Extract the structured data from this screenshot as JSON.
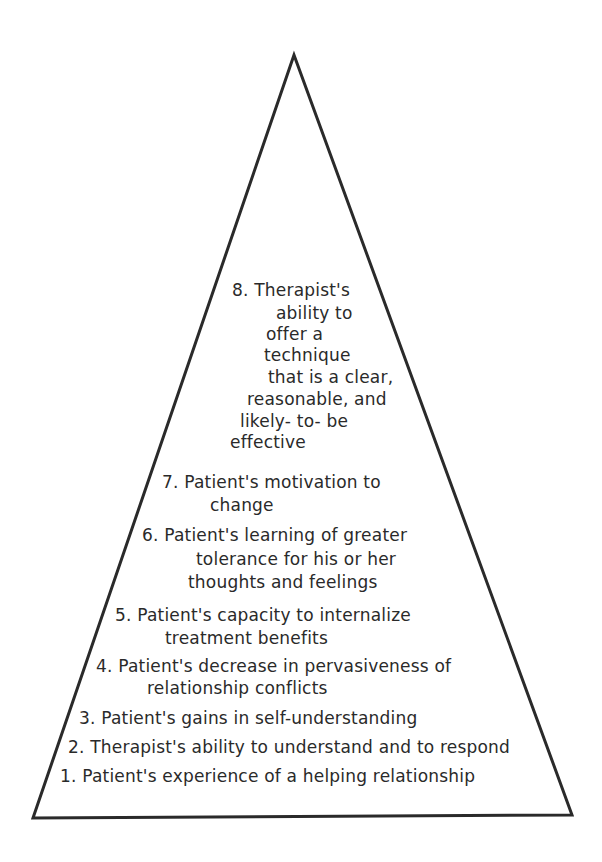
{
  "diagram": {
    "type": "pyramid",
    "shape": {
      "apex": [
        294,
        55
      ],
      "bottom_left": [
        33,
        818
      ],
      "bottom_right": [
        572,
        815
      ],
      "stroke_color": "#2a2a2a",
      "stroke_width": 3
    },
    "levels": [
      {
        "number": 8,
        "lines": [
          {
            "text": "8.  Therapist's",
            "x": 232,
            "y": 280
          },
          {
            "text": "ability  to",
            "x": 276,
            "y": 303
          },
          {
            "text": "offer  a",
            "x": 266,
            "y": 324
          },
          {
            "text": "technique",
            "x": 264,
            "y": 345
          },
          {
            "text": "that is a clear,",
            "x": 268,
            "y": 367
          },
          {
            "text": "reasonable, and",
            "x": 247,
            "y": 389
          },
          {
            "text": "likely- to- be",
            "x": 240,
            "y": 411
          },
          {
            "text": "effective",
            "x": 230,
            "y": 432
          }
        ]
      },
      {
        "number": 7,
        "lines": [
          {
            "text": "7.  Patient's motivation to",
            "x": 162,
            "y": 472
          },
          {
            "text": "change",
            "x": 210,
            "y": 495
          }
        ]
      },
      {
        "number": 6,
        "lines": [
          {
            "text": "6.  Patient's learning of greater",
            "x": 142,
            "y": 525
          },
          {
            "text": "tolerance for his or her",
            "x": 196,
            "y": 549
          },
          {
            "text": "thoughts and feelings",
            "x": 188,
            "y": 572
          }
        ]
      },
      {
        "number": 5,
        "lines": [
          {
            "text": "5.  Patient's capacity to internalize",
            "x": 115,
            "y": 605
          },
          {
            "text": "treatment benefits",
            "x": 165,
            "y": 628
          }
        ]
      },
      {
        "number": 4,
        "lines": [
          {
            "text": "4.  Patient's decrease in pervasiveness of",
            "x": 96,
            "y": 656
          },
          {
            "text": "relationship conflicts",
            "x": 147,
            "y": 678
          }
        ]
      },
      {
        "number": 3,
        "lines": [
          {
            "text": "3.  Patient's gains in self-understanding",
            "x": 79,
            "y": 708
          }
        ]
      },
      {
        "number": 2,
        "lines": [
          {
            "text": "2.  Therapist's ability to understand and to respond",
            "x": 68,
            "y": 737
          }
        ]
      },
      {
        "number": 1,
        "lines": [
          {
            "text": "1.  Patient's experience of a helping relationship",
            "x": 60,
            "y": 766
          }
        ]
      }
    ]
  }
}
